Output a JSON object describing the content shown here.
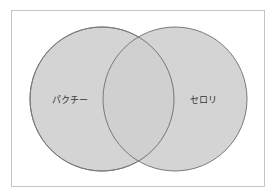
{
  "diagram": {
    "type": "venn",
    "sets": [
      {
        "label": "パクチー",
        "cx": 102,
        "cy": 99,
        "r": 72,
        "label_x": 70,
        "label_y": 99
      },
      {
        "label": "セロリ",
        "cx": 175,
        "cy": 99,
        "r": 72,
        "label_x": 202,
        "label_y": 99
      }
    ],
    "colors": {
      "fill": "#cfcfcf",
      "stroke": "#7a7a7a",
      "border": "#c4c4c4"
    }
  }
}
